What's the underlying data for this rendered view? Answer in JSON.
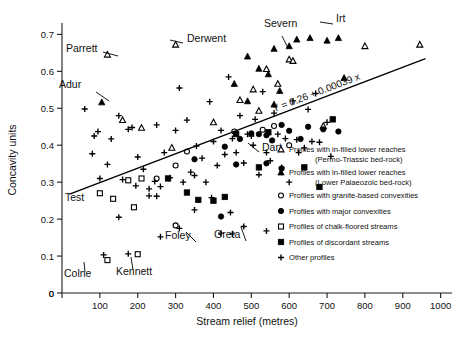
{
  "chart_data": {
    "type": "scatter",
    "title": "",
    "xlabel": "Stream relief (metres)",
    "ylabel": "Concavity units",
    "xlim": [
      0,
      1030
    ],
    "ylim": [
      0,
      0.72
    ],
    "xticks": [
      0,
      100,
      200,
      300,
      400,
      500,
      600,
      700,
      800,
      900,
      1000
    ],
    "xticklabels": [
      "0",
      "100",
      "200",
      "300",
      "400",
      "500",
      "600",
      "700",
      "800",
      "900",
      "1000"
    ],
    "yticks": [
      0,
      0.1,
      0.2,
      0.3,
      0.4,
      0.5,
      0.6,
      0.7
    ],
    "yticklabels": [
      "0",
      "0.1",
      "0.2",
      "0.3",
      "0.4",
      "0.5",
      "0.6",
      "0.7"
    ],
    "grid": false,
    "legend_position": "right-inside",
    "regression": {
      "label": "Y = 0.26 + 0.00039 x",
      "intercept": 0.26,
      "slope": 0.00039,
      "x_start": 20,
      "x_end": 960
    },
    "series": [
      {
        "name": "Profiles with in-filled lower reaches (Permo-Triassic bed-rock)",
        "marker": "open-triangle",
        "points": [
          [
            120,
            0.645
          ],
          [
            160,
            0.468
          ],
          [
            290,
            0.393
          ],
          [
            300,
            0.672
          ],
          [
            400,
            0.462
          ],
          [
            470,
            0.522
          ],
          [
            505,
            0.551
          ],
          [
            520,
            0.493
          ],
          [
            540,
            0.606
          ],
          [
            570,
            0.566
          ],
          [
            600,
            0.632
          ],
          [
            610,
            0.628
          ],
          [
            690,
            0.452
          ],
          [
            800,
            0.668
          ],
          [
            945,
            0.672
          ],
          [
            210,
            0.447
          ]
        ]
      },
      {
        "name": "Profiles with in-filled lower reaches (Lower Palaeozoic bed-rock)",
        "marker": "filled-triangle",
        "points": [
          [
            105,
            0.516
          ],
          [
            455,
            0.566
          ],
          [
            490,
            0.64
          ],
          [
            520,
            0.607
          ],
          [
            545,
            0.592
          ],
          [
            560,
            0.661
          ],
          [
            575,
            0.547
          ],
          [
            600,
            0.668
          ],
          [
            620,
            0.686
          ],
          [
            655,
            0.69
          ],
          [
            700,
            0.683
          ],
          [
            730,
            0.69
          ],
          [
            745,
            0.582
          ],
          [
            490,
            0.519
          ],
          [
            560,
            0.51
          ]
        ]
      },
      {
        "name": "Profiles with granite-based convexities",
        "marker": "open-circle",
        "points": [
          [
            250,
            0.31
          ],
          [
            330,
            0.383
          ],
          [
            300,
            0.345
          ],
          [
            455,
            0.437
          ],
          [
            530,
            0.442
          ],
          [
            560,
            0.452
          ],
          [
            600,
            0.4
          ],
          [
            300,
            0.183
          ]
        ]
      },
      {
        "name": "Profiles with major convexities",
        "marker": "filled-circle",
        "points": [
          [
            350,
            0.362
          ],
          [
            430,
            0.396
          ],
          [
            470,
            0.417
          ],
          [
            500,
            0.432
          ],
          [
            520,
            0.43
          ],
          [
            540,
            0.427
          ],
          [
            555,
            0.413
          ],
          [
            580,
            0.455
          ],
          [
            600,
            0.439
          ],
          [
            630,
            0.417
          ],
          [
            650,
            0.45
          ],
          [
            690,
            0.443
          ],
          [
            730,
            0.437
          ],
          [
            460,
            0.348
          ],
          [
            540,
            0.351
          ],
          [
            580,
            0.337
          ],
          [
            420,
            0.207
          ]
        ]
      },
      {
        "name": "Profiles of chalk-floored streams",
        "marker": "open-square",
        "points": [
          [
            100,
            0.27
          ],
          [
            135,
            0.255
          ],
          [
            190,
            0.232
          ],
          [
            175,
            0.305
          ],
          [
            210,
            0.31
          ],
          [
            120,
            0.089
          ],
          [
            200,
            0.105
          ]
        ]
      },
      {
        "name": "Profiles of discordant streams",
        "marker": "filled-square",
        "points": [
          [
            280,
            0.31
          ],
          [
            330,
            0.272
          ],
          [
            360,
            0.252
          ],
          [
            400,
            0.25
          ],
          [
            430,
            0.26
          ],
          [
            460,
            0.43
          ],
          [
            520,
            0.34
          ],
          [
            545,
            0.435
          ],
          [
            640,
            0.34
          ],
          [
            680,
            0.287
          ],
          [
            715,
            0.47
          ]
        ]
      },
      {
        "name": "Other profiles",
        "marker": "plus",
        "points": [
          [
            60,
            0.498
          ],
          [
            85,
            0.425
          ],
          [
            95,
            0.437
          ],
          [
            80,
            0.377
          ],
          [
            100,
            0.31
          ],
          [
            120,
            0.348
          ],
          [
            130,
            0.417
          ],
          [
            150,
            0.48
          ],
          [
            160,
            0.307
          ],
          [
            175,
            0.443
          ],
          [
            185,
            0.448
          ],
          [
            195,
            0.29
          ],
          [
            200,
            0.368
          ],
          [
            215,
            0.335
          ],
          [
            230,
            0.282
          ],
          [
            245,
            0.302
          ],
          [
            250,
            0.455
          ],
          [
            260,
            0.288
          ],
          [
            270,
            0.38
          ],
          [
            285,
            0.312
          ],
          [
            300,
            0.44
          ],
          [
            310,
            0.555
          ],
          [
            320,
            0.3
          ],
          [
            330,
            0.468
          ],
          [
            340,
            0.327
          ],
          [
            350,
            0.318
          ],
          [
            355,
            0.398
          ],
          [
            370,
            0.365
          ],
          [
            380,
            0.3
          ],
          [
            390,
            0.518
          ],
          [
            400,
            0.41
          ],
          [
            410,
            0.345
          ],
          [
            420,
            0.44
          ],
          [
            430,
            0.375
          ],
          [
            440,
            0.585
          ],
          [
            450,
            0.418
          ],
          [
            460,
            0.38
          ],
          [
            470,
            0.48
          ],
          [
            480,
            0.352
          ],
          [
            490,
            0.43
          ],
          [
            500,
            0.425
          ],
          [
            505,
            0.4
          ],
          [
            510,
            0.47
          ],
          [
            520,
            0.32
          ],
          [
            530,
            0.545
          ],
          [
            540,
            0.38
          ],
          [
            550,
            0.358
          ],
          [
            560,
            0.487
          ],
          [
            570,
            0.43
          ],
          [
            580,
            0.34
          ],
          [
            590,
            0.418
          ],
          [
            600,
            0.3
          ],
          [
            610,
            0.52
          ],
          [
            620,
            0.415
          ],
          [
            625,
            0.38
          ],
          [
            640,
            0.393
          ],
          [
            650,
            0.497
          ],
          [
            660,
            0.41
          ],
          [
            670,
            0.54
          ],
          [
            680,
            0.408
          ],
          [
            700,
            0.462
          ],
          [
            710,
            0.37
          ],
          [
            150,
            0.205
          ],
          [
            175,
            0.106
          ],
          [
            260,
            0.152
          ],
          [
            250,
            0.262
          ],
          [
            230,
            0.263
          ],
          [
            350,
            0.225
          ],
          [
            395,
            0.258
          ],
          [
            445,
            0.218
          ],
          [
            110,
            0.103
          ],
          [
            420,
            0.162
          ],
          [
            450,
            0.16
          ],
          [
            480,
            0.18
          ],
          [
            310,
            0.175
          ],
          [
            540,
            0.168
          ]
        ]
      }
    ],
    "annotations": [
      {
        "text": "Parrett",
        "x": 66,
        "y": 52,
        "anchor": "start"
      },
      {
        "text": "Adur",
        "x": 59,
        "y": 88,
        "anchor": "start"
      },
      {
        "text": "Derwent",
        "x": 187,
        "y": 42,
        "anchor": "start"
      },
      {
        "text": "Severn",
        "x": 264,
        "y": 27,
        "anchor": "start"
      },
      {
        "text": "Irt",
        "x": 336,
        "y": 22,
        "anchor": "start"
      },
      {
        "text": "Dart",
        "x": 262,
        "y": 151,
        "anchor": "start"
      },
      {
        "text": "Test",
        "x": 65,
        "y": 201,
        "anchor": "start"
      },
      {
        "text": "Colne",
        "x": 64,
        "y": 277,
        "anchor": "start"
      },
      {
        "text": "Kennett",
        "x": 116,
        "y": 275,
        "anchor": "start"
      },
      {
        "text": "Foley",
        "x": 165,
        "y": 239,
        "anchor": "start"
      },
      {
        "text": "Greta",
        "x": 214,
        "y": 238,
        "anchor": "start"
      }
    ]
  },
  "legend": {
    "items": [
      {
        "marker": "open-triangle",
        "line1": "Profiles with in-filled lower reaches",
        "line2": "(Permo-Triassic bed-rock)"
      },
      {
        "marker": "filled-triangle",
        "line1": "Profiles with in-filled lower reaches",
        "line2": "(Lower Palaeozoic bed-rock)"
      },
      {
        "marker": "open-circle",
        "line1": "Profiles with granite-based convexities",
        "line2": ""
      },
      {
        "marker": "filled-circle",
        "line1": "Profiles with major convexities",
        "line2": ""
      },
      {
        "marker": "open-square",
        "line1": "Profiles of chalk-floored streams",
        "line2": ""
      },
      {
        "marker": "filled-square",
        "line1": "Profiles of discordant streams",
        "line2": ""
      },
      {
        "marker": "plus",
        "line1": "Other profiles",
        "line2": ""
      }
    ]
  },
  "colors": {
    "ink": "#111111",
    "background": "#ffffff"
  }
}
